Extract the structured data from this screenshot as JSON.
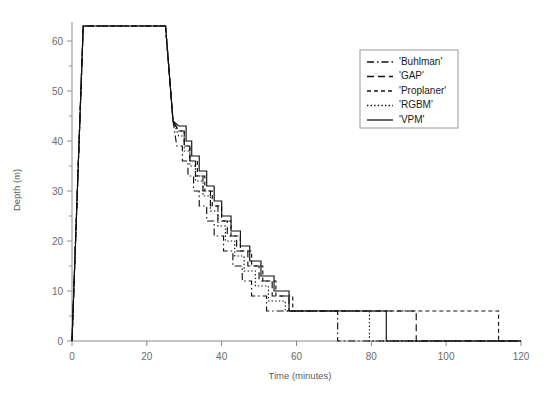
{
  "chart_data": {
    "type": "line",
    "title": "",
    "xlabel": "Time (minutes)",
    "ylabel": "Depth (m)",
    "xlim": [
      0,
      120
    ],
    "ylim": [
      0,
      65
    ],
    "xticks": [
      0,
      20,
      40,
      60,
      80,
      100,
      120
    ],
    "yticks": [
      0,
      10,
      20,
      30,
      40,
      50,
      60
    ],
    "grid": false,
    "legend_position": "top-right",
    "legend_entries": [
      "'Buhlman'",
      "'GAP'",
      "'Proplaner'",
      "'RGBM'",
      "'VPM'"
    ],
    "series": [
      {
        "name": "'Buhlman'",
        "dash": "dashdot",
        "surface_time": 72,
        "points": [
          [
            0,
            0
          ],
          [
            3,
            63
          ],
          [
            25,
            63
          ],
          [
            27,
            44
          ],
          [
            28,
            39
          ],
          [
            29.5,
            39
          ],
          [
            29.5,
            36
          ],
          [
            31,
            36
          ],
          [
            31,
            33
          ],
          [
            32.5,
            33
          ],
          [
            32.5,
            30
          ],
          [
            34,
            30
          ],
          [
            34,
            27
          ],
          [
            36,
            27
          ],
          [
            36,
            24
          ],
          [
            38,
            24
          ],
          [
            38,
            21
          ],
          [
            40.5,
            21
          ],
          [
            40.5,
            18
          ],
          [
            43,
            18
          ],
          [
            43,
            15
          ],
          [
            45.5,
            15
          ],
          [
            45.5,
            12
          ],
          [
            48,
            12
          ],
          [
            48,
            9
          ],
          [
            52,
            9
          ],
          [
            52,
            6
          ],
          [
            71,
            6
          ],
          [
            71,
            0
          ],
          [
            120,
            0
          ]
        ]
      },
      {
        "name": "'GAP'",
        "dash": "dashed",
        "surface_time": 92,
        "points": [
          [
            0,
            0
          ],
          [
            3,
            63
          ],
          [
            25,
            63
          ],
          [
            27,
            44
          ],
          [
            28.5,
            42
          ],
          [
            30,
            42
          ],
          [
            30,
            39
          ],
          [
            31.5,
            39
          ],
          [
            31.5,
            36
          ],
          [
            33,
            36
          ],
          [
            33,
            33
          ],
          [
            35,
            33
          ],
          [
            35,
            30
          ],
          [
            37,
            30
          ],
          [
            37,
            27
          ],
          [
            39,
            27
          ],
          [
            39,
            24
          ],
          [
            41.5,
            24
          ],
          [
            41.5,
            21
          ],
          [
            44,
            21
          ],
          [
            44,
            18
          ],
          [
            47,
            18
          ],
          [
            47,
            15
          ],
          [
            50,
            15
          ],
          [
            50,
            12
          ],
          [
            53.5,
            12
          ],
          [
            53.5,
            9
          ],
          [
            58,
            9
          ],
          [
            58,
            6
          ],
          [
            92,
            6
          ],
          [
            92,
            0
          ],
          [
            120,
            0
          ]
        ]
      },
      {
        "name": "'Proplaner'",
        "dash": "dotted-dash",
        "surface_time": 114,
        "points": [
          [
            0,
            0
          ],
          [
            3,
            63
          ],
          [
            25,
            63
          ],
          [
            27,
            44
          ],
          [
            28.5,
            42
          ],
          [
            30,
            42
          ],
          [
            30,
            39
          ],
          [
            31.5,
            39
          ],
          [
            31.5,
            36
          ],
          [
            33.5,
            36
          ],
          [
            33.5,
            33
          ],
          [
            35.5,
            33
          ],
          [
            35.5,
            30
          ],
          [
            37.5,
            30
          ],
          [
            37.5,
            27
          ],
          [
            40,
            27
          ],
          [
            40,
            24
          ],
          [
            42.5,
            24
          ],
          [
            42.5,
            21
          ],
          [
            45,
            21
          ],
          [
            45,
            18
          ],
          [
            48,
            18
          ],
          [
            48,
            15
          ],
          [
            51,
            15
          ],
          [
            51,
            12
          ],
          [
            54.5,
            12
          ],
          [
            54.5,
            9
          ],
          [
            59,
            9
          ],
          [
            59,
            6
          ],
          [
            114,
            6
          ],
          [
            114,
            0
          ],
          [
            120,
            0
          ]
        ]
      },
      {
        "name": "'RGBM'",
        "dash": "fine-dotted",
        "surface_time": 80,
        "points": [
          [
            0,
            0
          ],
          [
            3,
            63
          ],
          [
            25,
            63
          ],
          [
            27,
            44
          ],
          [
            28.5,
            41
          ],
          [
            30,
            41
          ],
          [
            30,
            38
          ],
          [
            31.5,
            38
          ],
          [
            31.5,
            35
          ],
          [
            33,
            35
          ],
          [
            33,
            32
          ],
          [
            35,
            32
          ],
          [
            35,
            29
          ],
          [
            37,
            29
          ],
          [
            37,
            26
          ],
          [
            39,
            26
          ],
          [
            39,
            23
          ],
          [
            41,
            23
          ],
          [
            41,
            20
          ],
          [
            43.5,
            20
          ],
          [
            43.5,
            17
          ],
          [
            46,
            17
          ],
          [
            46,
            14
          ],
          [
            49,
            14
          ],
          [
            49,
            11
          ],
          [
            52.5,
            11
          ],
          [
            52.5,
            8
          ],
          [
            57,
            8
          ],
          [
            57,
            6
          ],
          [
            79.5,
            6
          ],
          [
            79.5,
            0
          ],
          [
            120,
            0
          ]
        ]
      },
      {
        "name": "'VPM'",
        "dash": "solid",
        "surface_time": 84,
        "points": [
          [
            0,
            0
          ],
          [
            3,
            63
          ],
          [
            25,
            63
          ],
          [
            27,
            44
          ],
          [
            28.5,
            43
          ],
          [
            30.5,
            43
          ],
          [
            30.5,
            40
          ],
          [
            32,
            40
          ],
          [
            32,
            37
          ],
          [
            34,
            37
          ],
          [
            34,
            34
          ],
          [
            36,
            34
          ],
          [
            36,
            31
          ],
          [
            38,
            31
          ],
          [
            38,
            28
          ],
          [
            40,
            28
          ],
          [
            40,
            25
          ],
          [
            42.5,
            25
          ],
          [
            42.5,
            22
          ],
          [
            45,
            22
          ],
          [
            45,
            19
          ],
          [
            47.5,
            19
          ],
          [
            47.5,
            16
          ],
          [
            50.5,
            16
          ],
          [
            50.5,
            13
          ],
          [
            54,
            13
          ],
          [
            54,
            10
          ],
          [
            58,
            10
          ],
          [
            58,
            6
          ],
          [
            84,
            6
          ],
          [
            84,
            0
          ],
          [
            120,
            0
          ]
        ]
      }
    ]
  }
}
